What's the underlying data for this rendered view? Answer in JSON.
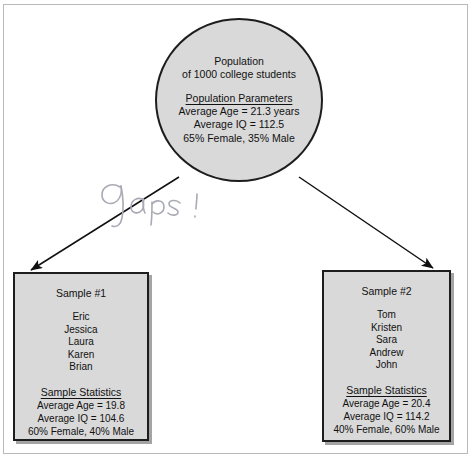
{
  "diagram": {
    "population": {
      "title_line_1": "Population",
      "title_line_2": "of 1000 college students",
      "parameters_heading": "Population Parameters",
      "parameters": [
        "Average Age = 21.3 years",
        "Average IQ = 112.5",
        "65% Female, 35% Male"
      ]
    },
    "annotation": {
      "text": "Gaps!",
      "style": "handwritten-pencil"
    },
    "samples": [
      {
        "title": "Sample #1",
        "names": [
          "Eric",
          "Jessica",
          "Laura",
          "Karen",
          "Brian"
        ],
        "stats_heading": "Sample Statistics",
        "stats": [
          "Average Age = 19.8",
          "Average IQ = 104.6",
          "60% Female, 40% Male"
        ]
      },
      {
        "title": "Sample #2",
        "names": [
          "Tom",
          "Kristen",
          "Sara",
          "Andrew",
          "John"
        ],
        "stats_heading": "Sample Statistics",
        "stats": [
          "Average Age = 20.4",
          "Average IQ = 114.2",
          "40% Female, 60% Male"
        ]
      }
    ],
    "connectors": [
      {
        "name": "arrow-to-sample-1",
        "from": "population-circle",
        "to": "sample-box-1"
      },
      {
        "name": "arrow-to-sample-2",
        "from": "population-circle",
        "to": "sample-box-2"
      }
    ]
  },
  "colors": {
    "shape_fill": "#d9d9d9",
    "shape_stroke": "#1d1d1d",
    "page_background": "#ffffff",
    "frame_border": "#b9b9b9",
    "annotation_ink": "#a9aab3"
  }
}
